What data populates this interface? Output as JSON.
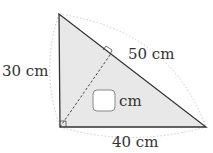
{
  "diagram": {
    "type": "right-triangle",
    "labels": {
      "left_side": "30 cm",
      "hypotenuse": "50 cm",
      "bottom_side": "40 cm",
      "unknown_unit": "cm"
    },
    "colors": {
      "fill": "#e8e8e8",
      "stroke": "#333333",
      "arc": "#bbbbbb",
      "box_stroke": "#888888"
    }
  }
}
